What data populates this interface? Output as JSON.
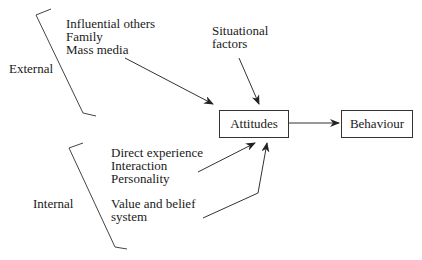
{
  "diagram": {
    "groups": {
      "external": {
        "label": "External",
        "items": [
          "Influential others",
          "Family",
          "Mass media"
        ]
      },
      "situational": {
        "lines": [
          "Situational",
          "factors"
        ]
      },
      "internal": {
        "label": "Internal",
        "items_a": [
          "Direct experience",
          "Interaction",
          "Personality"
        ],
        "items_b": [
          "Value and belief",
          "system"
        ]
      }
    },
    "nodes": {
      "attitudes": "Attitudes",
      "behaviour": "Behaviour"
    },
    "edges": [
      {
        "from": "external",
        "to": "attitudes"
      },
      {
        "from": "situational",
        "to": "attitudes"
      },
      {
        "from": "internal_a",
        "to": "attitudes"
      },
      {
        "from": "internal_b",
        "to": "attitudes"
      },
      {
        "from": "attitudes",
        "to": "behaviour"
      }
    ],
    "colors": {
      "line": "#333333",
      "text": "#1a1a1a",
      "background": "#ffffff"
    }
  }
}
